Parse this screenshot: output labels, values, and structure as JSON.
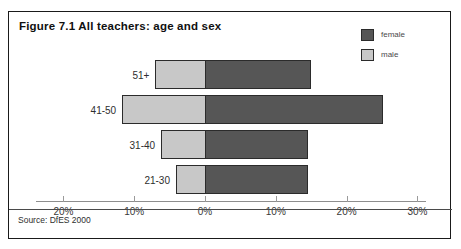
{
  "figure": {
    "title": "Figure 7.1 All teachers: age and sex",
    "source": "Source: DfES 2000"
  },
  "legend": {
    "position": "top-right",
    "entries": [
      {
        "label": "female",
        "color": "#565656"
      },
      {
        "label": "male",
        "color": "#c8c8c8"
      }
    ]
  },
  "axis": {
    "ticks": [
      "20%",
      "10%",
      "0%",
      "10%",
      "20%",
      "30%"
    ]
  },
  "chart_data": {
    "type": "bar",
    "orientation": "horizontal",
    "style": "back-to-back-pyramid",
    "title": "Figure 7.1 All teachers: age and sex",
    "xlabel": "",
    "ylabel": "",
    "categories": [
      "51+",
      "41-50",
      "31-40",
      "21-30"
    ],
    "tick_labels": [
      "20%",
      "10%",
      "0%",
      "10%",
      "20%",
      "30%"
    ],
    "tick_values": [
      -20,
      -10,
      0,
      10,
      20,
      30
    ],
    "xlim": [
      -20,
      30
    ],
    "grid": false,
    "legend_position": "top-right",
    "series": [
      {
        "name": "male",
        "color": "#c8c8c8",
        "side": "left",
        "values": [
          7.0,
          11.7,
          6.2,
          4.1
        ]
      },
      {
        "name": "female",
        "color": "#565656",
        "side": "right",
        "values": [
          15.0,
          25.2,
          14.6,
          14.6
        ]
      }
    ],
    "annotations": [
      "Source: DfES 2000"
    ]
  }
}
